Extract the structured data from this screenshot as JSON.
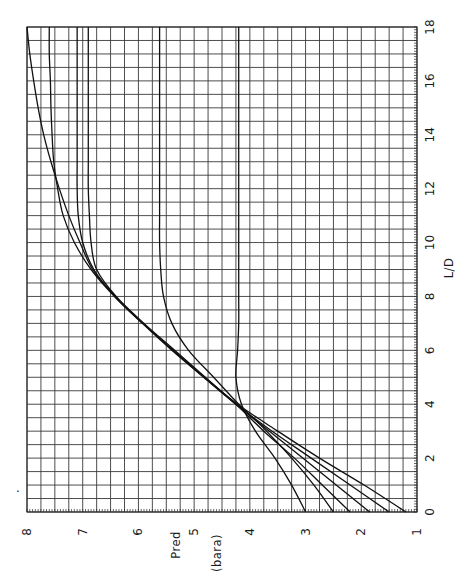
{
  "chart_data": {
    "type": "line",
    "title": "",
    "orientation_note": "figure rotated 90 degrees counter-clockwise; L/D axis along right side, Pred axis along bottom",
    "xlabel": "L/D",
    "ylabel": "Pred (bara)",
    "ylabel_parts": [
      "Pred",
      "(bara)"
    ],
    "xlim": [
      0,
      18
    ],
    "ylim": [
      1,
      8
    ],
    "x_ticks": [
      0,
      2,
      4,
      6,
      8,
      10,
      12,
      14,
      16,
      18
    ],
    "y_ticks": [
      1,
      2,
      3,
      4,
      5,
      6,
      7,
      8
    ],
    "x_tick_labels": [
      "0",
      "2",
      "4",
      "6",
      "8",
      "10",
      "12",
      "14",
      "16",
      "18"
    ],
    "y_tick_labels": [
      "1",
      "2",
      "3",
      "4",
      "5",
      "6",
      "7",
      "8"
    ],
    "grid": true,
    "grid_minor_x": 0.5,
    "grid_minor_y": 0.25,
    "legend": null,
    "series": [
      {
        "name": "curve-1",
        "x": [
          0,
          1,
          2,
          3,
          4,
          5,
          6,
          7,
          8,
          9,
          10,
          11,
          12,
          13,
          14,
          15,
          16,
          17,
          18
        ],
        "y": [
          3.0,
          3.25,
          3.55,
          3.9,
          4.15,
          4.25,
          4.22,
          4.2,
          4.2,
          4.2,
          4.2,
          4.2,
          4.2,
          4.2,
          4.2,
          4.2,
          4.2,
          4.2,
          4.2
        ]
      },
      {
        "name": "curve-2",
        "x": [
          0,
          1,
          2,
          3,
          4,
          5,
          6,
          7,
          8,
          9,
          10,
          11,
          12,
          13,
          14,
          15,
          16,
          17,
          18
        ],
        "y": [
          2.5,
          2.85,
          3.25,
          3.7,
          4.2,
          4.65,
          5.1,
          5.4,
          5.55,
          5.6,
          5.62,
          5.62,
          5.62,
          5.62,
          5.62,
          5.62,
          5.62,
          5.62,
          5.62
        ]
      },
      {
        "name": "curve-3",
        "x": [
          0,
          1,
          2,
          3,
          4,
          5,
          6,
          7,
          8,
          9,
          10,
          11,
          12,
          13,
          14,
          15,
          16,
          17,
          18
        ],
        "y": [
          2.2,
          2.7,
          3.2,
          3.75,
          4.25,
          4.8,
          5.35,
          5.9,
          6.4,
          6.75,
          6.85,
          6.88,
          6.9,
          6.9,
          6.9,
          6.9,
          6.9,
          6.9,
          6.9
        ]
      },
      {
        "name": "curve-4",
        "x": [
          0,
          1,
          2,
          3,
          4,
          5,
          6,
          7,
          8,
          9,
          10,
          11,
          12,
          13,
          14,
          15,
          16,
          17,
          18
        ],
        "y": [
          1.85,
          2.45,
          3.05,
          3.65,
          4.25,
          4.82,
          5.38,
          5.92,
          6.42,
          6.8,
          7.0,
          7.08,
          7.1,
          7.1,
          7.1,
          7.1,
          7.1,
          7.1,
          7.1
        ]
      },
      {
        "name": "curve-5",
        "x": [
          0,
          1,
          2,
          3,
          4,
          5,
          6,
          7,
          8,
          9,
          10,
          11,
          12,
          13,
          14,
          15,
          16,
          17,
          18
        ],
        "y": [
          1.5,
          2.2,
          2.9,
          3.6,
          4.25,
          4.83,
          5.4,
          5.93,
          6.43,
          6.85,
          7.15,
          7.35,
          7.45,
          7.52,
          7.55,
          7.57,
          7.58,
          7.6,
          7.6
        ]
      },
      {
        "name": "curve-6",
        "x": [
          0,
          1,
          2,
          3,
          4,
          5,
          6,
          7,
          8,
          9,
          10,
          11,
          12,
          13,
          14,
          15,
          16,
          17,
          18
        ],
        "y": [
          1.2,
          1.95,
          2.75,
          3.5,
          4.22,
          4.82,
          5.38,
          5.92,
          6.42,
          6.82,
          7.05,
          7.25,
          7.42,
          7.57,
          7.7,
          7.8,
          7.88,
          7.95,
          8.0
        ]
      }
    ]
  },
  "annotations": {
    "stray_mark": "."
  }
}
